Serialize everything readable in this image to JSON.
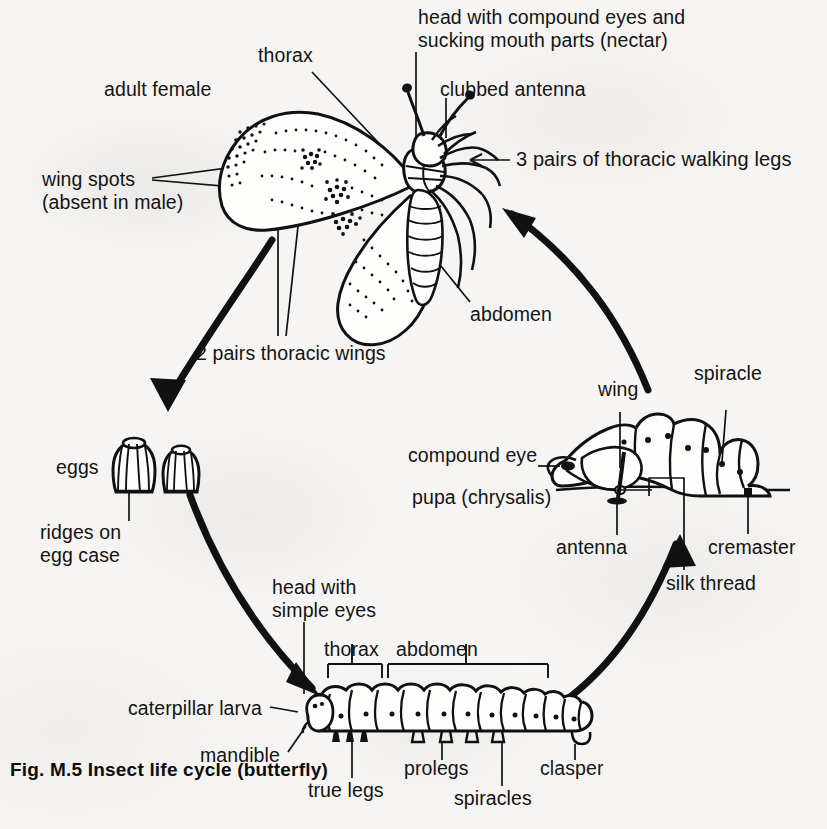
{
  "figure": {
    "caption": "Fig. M.5 Insect life cycle (butterfly)",
    "subject": "Insect life cycle (butterfly)",
    "background_color": "#f6f5f3",
    "ink_color": "#121212"
  },
  "stages": {
    "adult": {
      "name": "adult female",
      "labels": {
        "adult_female": "adult female",
        "thorax": "thorax",
        "head": "head with compound eyes and\nsucking mouth parts (nectar)",
        "head_line1": "head with compound eyes and",
        "head_line2": "sucking mouth parts (nectar)",
        "clubbed_antenna": "clubbed antenna",
        "walking_legs": "3 pairs of thoracic walking legs",
        "abdomen": "abdomen",
        "wing_spots": "wing spots\n(absent in male)",
        "wing_spots_line1": "wing spots",
        "wing_spots_line2": "(absent in male)",
        "thoracic_wings": "2 pairs thoracic wings"
      }
    },
    "eggs": {
      "name": "eggs",
      "labels": {
        "eggs": "eggs",
        "ridges": "ridges on\negg case",
        "ridges_line1": "ridges on",
        "ridges_line2": "egg case"
      },
      "count": 2
    },
    "larva": {
      "name": "caterpillar larva",
      "labels": {
        "caterpillar_larva": "caterpillar larva",
        "head_simple_eyes": "head with\nsimple eyes",
        "head_line1": "head with",
        "head_line2": "simple eyes",
        "thorax": "thorax",
        "abdomen": "abdomen",
        "mandible": "mandible",
        "true_legs": "true legs",
        "prolegs": "prolegs",
        "spiracles": "spiracles",
        "clasper": "clasper"
      },
      "segments": 13
    },
    "pupa": {
      "name": "pupa (chrysalis)",
      "labels": {
        "pupa": "pupa (chrysalis)",
        "wing": "wing",
        "spiracle": "spiracle",
        "compound_eye": "compound eye",
        "antenna": "antenna",
        "cremaster": "cremaster",
        "silk_thread": "silk thread"
      }
    }
  },
  "cycle_arrows": [
    {
      "id": "adult-to-eggs",
      "from": "adult",
      "to": "eggs",
      "direction": "down-left"
    },
    {
      "id": "eggs-to-larva",
      "from": "eggs",
      "to": "caterpillar larva",
      "direction": "down-right"
    },
    {
      "id": "larva-to-pupa",
      "from": "caterpillar larva",
      "to": "pupa",
      "direction": "up-right"
    },
    {
      "id": "pupa-to-adult",
      "from": "pupa",
      "to": "adult",
      "direction": "up-left"
    }
  ]
}
